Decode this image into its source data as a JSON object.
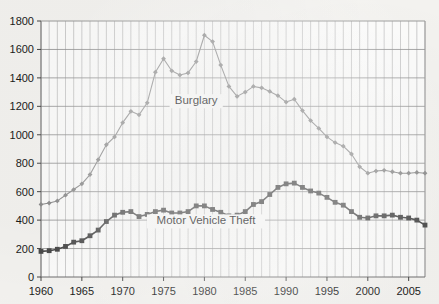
{
  "chart_data": {
    "type": "line",
    "title": "",
    "subtitle": "",
    "xlabel": "",
    "ylabel": "",
    "xlim": [
      1960,
      2007
    ],
    "ylim": [
      0,
      1800
    ],
    "grid": true,
    "grid_x_every": 1,
    "grid_y_every": 200,
    "legend": "inline-annotations",
    "y_ticks": [
      0,
      200,
      400,
      600,
      800,
      1000,
      1200,
      1400,
      1600,
      1800
    ],
    "y_tick_labels": [
      "0",
      "200",
      "400",
      "600",
      "800",
      "1000",
      "1200",
      "1400",
      "1600",
      "1800"
    ],
    "x_ticks": [
      1960,
      1965,
      1970,
      1975,
      1980,
      1985,
      1990,
      1995,
      2000,
      2005
    ],
    "x_tick_labels": [
      "1960",
      "1965",
      "1970",
      "1975",
      "1980",
      "1985",
      "1990",
      "1995",
      "2000",
      "2005"
    ],
    "x": [
      1960,
      1961,
      1962,
      1963,
      1964,
      1965,
      1966,
      1967,
      1968,
      1969,
      1970,
      1971,
      1972,
      1973,
      1974,
      1975,
      1976,
      1977,
      1978,
      1979,
      1980,
      1981,
      1982,
      1983,
      1984,
      1985,
      1986,
      1987,
      1988,
      1989,
      1990,
      1991,
      1992,
      1993,
      1994,
      1995,
      1996,
      1997,
      1998,
      1999,
      2000,
      2001,
      2002,
      2003,
      2004,
      2005,
      2006,
      2007
    ],
    "series": [
      {
        "name": "Burglary",
        "label": "Burglary",
        "color": "#8a8a8a",
        "marker": "diamond",
        "values": [
          510,
          520,
          535,
          575,
          615,
          655,
          720,
          825,
          930,
          985,
          1085,
          1165,
          1140,
          1225,
          1440,
          1535,
          1450,
          1420,
          1435,
          1515,
          1700,
          1655,
          1490,
          1340,
          1270,
          1300,
          1340,
          1330,
          1305,
          1275,
          1230,
          1250,
          1170,
          1100,
          1045,
          985,
          945,
          920,
          865,
          775,
          730,
          745,
          750,
          740,
          730,
          730,
          735,
          730
        ]
      },
      {
        "name": "Motor Vehicle Theft",
        "label": "Motor Vehicle Theft",
        "color": "#4a4a4a",
        "marker": "square",
        "values": [
          180,
          185,
          195,
          215,
          245,
          255,
          290,
          330,
          390,
          435,
          455,
          460,
          425,
          440,
          460,
          470,
          450,
          450,
          460,
          500,
          500,
          475,
          455,
          430,
          435,
          460,
          510,
          530,
          580,
          630,
          655,
          660,
          630,
          605,
          590,
          560,
          525,
          505,
          460,
          420,
          415,
          430,
          430,
          435,
          420,
          415,
          400,
          365
        ]
      }
    ]
  }
}
